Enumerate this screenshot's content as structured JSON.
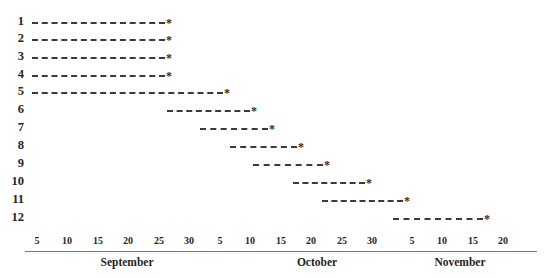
{
  "chart_data": {
    "type": "bar",
    "subtype": "gantt",
    "title": "",
    "xlabel": "",
    "ylabel": "",
    "grid": false,
    "legend": null,
    "categories": [
      "1",
      "2",
      "3",
      "4",
      "5",
      "6",
      "7",
      "8",
      "9",
      "10",
      "11",
      "12"
    ],
    "axis": {
      "tick_labels": [
        "5",
        "10",
        "15",
        "20",
        "25",
        "30",
        "5",
        "10",
        "15",
        "20",
        "25",
        "30",
        "5",
        "10",
        "15",
        "20"
      ],
      "tick_positions_px": [
        37,
        67,
        98,
        128,
        159,
        189,
        220,
        250,
        281,
        311,
        342,
        372,
        412,
        442,
        473,
        503
      ],
      "month_labels": [
        "September",
        "October",
        "November"
      ],
      "month_positions_px": [
        127,
        317,
        460
      ],
      "line_start_px": 25,
      "line_end_px": 537
    },
    "series": [
      {
        "task": "1",
        "start_px": 32,
        "end_px": 165,
        "marker": "*",
        "marker_px": 166,
        "start_label": "Sep 1",
        "end_label": "Sep 26"
      },
      {
        "task": "2",
        "start_px": 32,
        "end_px": 165,
        "marker": "*",
        "marker_px": 166,
        "start_label": "Sep 1",
        "end_label": "Sep 26"
      },
      {
        "task": "3",
        "start_px": 32,
        "end_px": 165,
        "marker": "*",
        "marker_px": 166,
        "start_label": "Sep 1",
        "end_label": "Sep 26"
      },
      {
        "task": "4",
        "start_px": 32,
        "end_px": 165,
        "marker": "*",
        "marker_px": 166,
        "start_label": "Sep 1",
        "end_label": "Sep 26"
      },
      {
        "task": "5",
        "start_px": 32,
        "end_px": 223,
        "marker": "*",
        "marker_px": 224,
        "start_label": "Sep 1",
        "end_label": "Oct 6"
      },
      {
        "task": "6",
        "start_px": 167,
        "end_px": 250,
        "marker": "*",
        "marker_px": 251,
        "start_label": "Sep 26",
        "end_label": "Oct 10"
      },
      {
        "task": "7",
        "start_px": 200,
        "end_px": 268,
        "marker": "*",
        "marker_px": 269,
        "start_label": "Oct 1",
        "end_label": "Oct 13"
      },
      {
        "task": "8",
        "start_px": 230,
        "end_px": 297,
        "marker": "*",
        "marker_px": 298,
        "start_label": "Oct 6",
        "end_label": "Oct 17"
      },
      {
        "task": "9",
        "start_px": 253,
        "end_px": 323,
        "marker": "*",
        "marker_px": 324,
        "start_label": "Oct 10",
        "end_label": "Oct 22"
      },
      {
        "task": "10",
        "start_px": 293,
        "end_px": 365,
        "marker": "*",
        "marker_px": 366,
        "start_label": "Oct 16",
        "end_label": "Oct 28"
      },
      {
        "task": "11",
        "start_px": 322,
        "end_px": 403,
        "marker": "*",
        "marker_px": 404,
        "start_label": "Oct 21",
        "end_label": "Nov 4"
      },
      {
        "task": "12",
        "start_px": 393,
        "end_px": 483,
        "marker": "*",
        "marker_px": 484,
        "start_label": "Nov 2",
        "end_label": "Nov 17"
      }
    ],
    "row_positions_px": [
      22,
      39,
      57,
      75,
      92,
      110,
      128,
      146,
      164,
      182,
      200,
      218
    ],
    "colors": {
      "bar": "#3a3a3a",
      "axis": "#7a7a7a",
      "text": "#262626",
      "background": "#ffffff"
    }
  }
}
